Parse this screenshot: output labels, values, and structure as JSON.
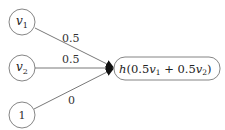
{
  "diagram": {
    "inputs": [
      {
        "id": "v1",
        "base": "v",
        "sub": "1",
        "cx": 22,
        "cy": 22
      },
      {
        "id": "v2",
        "base": "v",
        "sub": "2",
        "cx": 22,
        "cy": 68
      },
      {
        "id": "bias",
        "base": "1",
        "sub": "",
        "cx": 22,
        "cy": 115
      }
    ],
    "edges": [
      {
        "from": "v1",
        "weight": "0.5"
      },
      {
        "from": "v2",
        "weight": "0.5"
      },
      {
        "from": "bias",
        "weight": "0"
      }
    ],
    "output": {
      "h": "h",
      "open": "(0.5",
      "v1": "v",
      "s1": "1",
      "plus": " + 0.5",
      "v2": "v",
      "s2": "2",
      "close": ")"
    },
    "colors": {
      "stroke": "#555555",
      "arrow": "#111111",
      "text": "#222222"
    }
  }
}
